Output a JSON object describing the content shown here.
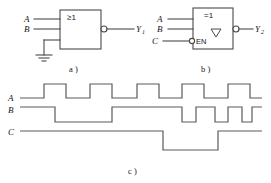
{
  "figure": {
    "captions": {
      "a": "a )",
      "b": "b )",
      "c": "c )"
    }
  },
  "gate_a": {
    "symbol": "≥1",
    "symbol_name": "or-gate-iec",
    "inputs": [
      {
        "label": "A",
        "name": "input-a"
      },
      {
        "label": "B",
        "name": "input-b"
      },
      {
        "label": "",
        "name": "input-ground"
      }
    ],
    "output": {
      "label": "Y",
      "sub": "1",
      "inverted": true
    },
    "ground": "ground-symbol"
  },
  "gate_b": {
    "symbol": "=1",
    "symbol_name": "xor-gate-iec",
    "open_collector": "▽",
    "enable_label": "EN",
    "inputs": [
      {
        "label": "A",
        "name": "input-a"
      },
      {
        "label": "B",
        "name": "input-b"
      },
      {
        "label": "C",
        "name": "input-c-enable",
        "inverted": true
      }
    ],
    "output": {
      "label": "Y",
      "sub": "2",
      "inverted": true
    }
  },
  "timing": {
    "signals": [
      {
        "label": "A",
        "name": "waveform-a"
      },
      {
        "label": "B",
        "name": "waveform-b"
      },
      {
        "label": "C",
        "name": "waveform-c"
      }
    ]
  },
  "chart_data": {
    "type": "line",
    "xlabel": "",
    "ylabel": "",
    "x_range": [
      20,
      262
    ],
    "grid": false,
    "legend": "left-axis-labels",
    "series": [
      {
        "name": "A",
        "high_y": 84,
        "low_y": 98,
        "baseline": "low",
        "transitions": [
          20,
          44,
          66,
          90,
          112,
          137,
          159,
          182,
          204,
          228,
          250,
          262
        ],
        "levels": [
          0,
          1,
          0,
          1,
          0,
          1,
          0,
          1,
          0,
          1,
          0
        ]
      },
      {
        "name": "B",
        "high_y": 107,
        "low_y": 122,
        "baseline": "high",
        "transitions": [
          20,
          55,
          112,
          182,
          196,
          215,
          228,
          242,
          252,
          262
        ],
        "levels": [
          1,
          0,
          1,
          0,
          1,
          0,
          1,
          0,
          1
        ]
      },
      {
        "name": "C",
        "high_y": 131,
        "low_y": 150,
        "baseline": "high",
        "transitions": [
          20,
          163,
          218,
          262
        ],
        "levels": [
          1,
          0,
          1
        ]
      }
    ]
  },
  "colors": {
    "line": "#4a4a4a",
    "wave": "#5a5a5a",
    "text": "#161616",
    "background": "#ffffff"
  }
}
